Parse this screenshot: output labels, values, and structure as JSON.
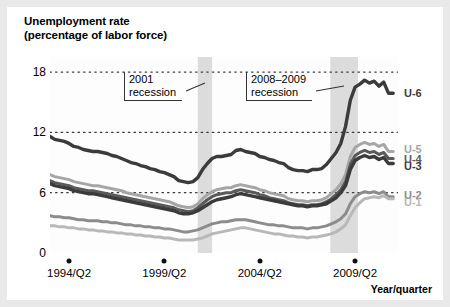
{
  "chart_data": {
    "type": "line",
    "title": "Unemployment rate",
    "subtitle": "(percentage of labor force)",
    "xlabel": "Year/quarter",
    "ylabel": "Unemployment rate (percentage of labor force)",
    "ylim": [
      0,
      19.5
    ],
    "yticks": [
      0,
      6,
      12,
      18
    ],
    "ytick_labels": [
      "0",
      "6",
      "12",
      "18"
    ],
    "grid": "horizontal-dotted",
    "legend_position": "right-end-of-line",
    "xlim": [
      1993.25,
      2011.5
    ],
    "xticks": [
      1994.25,
      1999.25,
      2004.25,
      2009.25
    ],
    "xtick_labels": [
      "1994/Q2",
      "1999/Q2",
      "2004/Q2",
      "2009/Q2"
    ],
    "annotations": [
      {
        "name": "recession-2001",
        "lines": [
          "2001",
          "recession"
        ],
        "span_start": 2001.0,
        "span_end": 2001.75
      },
      {
        "name": "recession-2008-2009",
        "lines": [
          "2008–2009",
          "recession"
        ],
        "span_start": 2007.95,
        "span_end": 2009.4
      }
    ],
    "shaded_bands": [
      {
        "label": "2001 recession",
        "start": 2001.0,
        "end": 2001.75,
        "color": "#dcdcdc"
      },
      {
        "label": "2008-2009 recession",
        "start": 2007.95,
        "end": 2009.4,
        "color": "#dcdcdc"
      }
    ],
    "x": [
      1993.25,
      1993.5,
      1993.75,
      1994.0,
      1994.25,
      1994.5,
      1994.75,
      1995.0,
      1995.25,
      1995.5,
      1995.75,
      1996.0,
      1996.25,
      1996.5,
      1996.75,
      1997.0,
      1997.25,
      1997.5,
      1997.75,
      1998.0,
      1998.25,
      1998.5,
      1998.75,
      1999.0,
      1999.25,
      1999.5,
      1999.75,
      2000.0,
      2000.25,
      2000.5,
      2000.75,
      2001.0,
      2001.25,
      2001.5,
      2001.75,
      2002.0,
      2002.25,
      2002.5,
      2002.75,
      2003.0,
      2003.25,
      2003.5,
      2003.75,
      2004.0,
      2004.25,
      2004.5,
      2004.75,
      2005.0,
      2005.25,
      2005.5,
      2005.75,
      2006.0,
      2006.25,
      2006.5,
      2006.75,
      2007.0,
      2007.25,
      2007.5,
      2007.75,
      2008.0,
      2008.25,
      2008.5,
      2008.75,
      2009.0,
      2009.25,
      2009.5,
      2009.75,
      2010.0,
      2010.25,
      2010.5,
      2010.75,
      2011.0,
      2011.25
    ],
    "series": [
      {
        "name": "U-6",
        "color": "#3b3b3b",
        "width": 3.4,
        "label": "U-6",
        "values": [
          11.6,
          11.3,
          11.2,
          11.1,
          10.9,
          10.6,
          10.5,
          10.3,
          10.2,
          10.1,
          10.1,
          10.0,
          9.9,
          9.7,
          9.6,
          9.4,
          9.2,
          9.0,
          8.9,
          8.7,
          8.6,
          8.4,
          8.3,
          8.1,
          8.0,
          7.8,
          7.6,
          7.2,
          7.1,
          7.0,
          7.1,
          7.5,
          8.3,
          8.9,
          9.4,
          9.6,
          9.6,
          9.7,
          9.8,
          10.2,
          10.3,
          10.1,
          10.0,
          9.9,
          9.6,
          9.5,
          9.3,
          9.2,
          9.0,
          8.9,
          8.5,
          8.3,
          8.2,
          8.2,
          8.1,
          8.3,
          8.3,
          8.4,
          8.8,
          9.4,
          10.0,
          10.9,
          12.6,
          15.2,
          16.5,
          16.8,
          17.2,
          16.9,
          17.1,
          16.6,
          17.0,
          15.9,
          15.9
        ]
      },
      {
        "name": "U-5",
        "color": "#a6a6a6",
        "width": 3.0,
        "label": "U-5",
        "values": [
          7.8,
          7.6,
          7.5,
          7.4,
          7.3,
          7.1,
          7.0,
          6.9,
          6.8,
          6.7,
          6.7,
          6.6,
          6.5,
          6.4,
          6.3,
          6.2,
          6.0,
          5.9,
          5.8,
          5.7,
          5.6,
          5.5,
          5.4,
          5.3,
          5.2,
          5.1,
          4.9,
          4.7,
          4.6,
          4.5,
          4.6,
          4.9,
          5.4,
          5.8,
          6.1,
          6.3,
          6.4,
          6.5,
          6.5,
          6.7,
          6.8,
          6.7,
          6.6,
          6.5,
          6.3,
          6.2,
          6.0,
          5.9,
          5.8,
          5.7,
          5.4,
          5.3,
          5.2,
          5.2,
          5.1,
          5.2,
          5.2,
          5.3,
          5.5,
          5.9,
          6.3,
          6.9,
          7.8,
          9.6,
          10.5,
          10.8,
          11.0,
          10.8,
          10.9,
          10.6,
          10.8,
          10.1,
          10.1
        ]
      },
      {
        "name": "U-4",
        "color": "#5a5a5a",
        "width": 3.0,
        "label": "U-4",
        "values": [
          7.2,
          7.0,
          6.9,
          6.8,
          6.7,
          6.5,
          6.4,
          6.3,
          6.2,
          6.2,
          6.1,
          6.0,
          5.9,
          5.8,
          5.7,
          5.6,
          5.5,
          5.4,
          5.3,
          5.2,
          5.1,
          5.0,
          4.9,
          4.8,
          4.7,
          4.6,
          4.5,
          4.3,
          4.2,
          4.1,
          4.2,
          4.5,
          4.9,
          5.3,
          5.6,
          5.8,
          5.9,
          6.0,
          6.0,
          6.2,
          6.3,
          6.2,
          6.1,
          6.0,
          5.8,
          5.7,
          5.5,
          5.4,
          5.3,
          5.2,
          5.0,
          4.9,
          4.8,
          4.8,
          4.7,
          4.8,
          4.8,
          4.9,
          5.1,
          5.4,
          5.8,
          6.3,
          7.1,
          8.8,
          9.7,
          10.0,
          10.2,
          10.0,
          10.1,
          9.8,
          10.0,
          9.4,
          9.4
        ]
      },
      {
        "name": "U-3",
        "color": "#3b3b3b",
        "width": 3.4,
        "label": "U-3",
        "values": [
          6.9,
          6.7,
          6.6,
          6.5,
          6.4,
          6.2,
          6.1,
          6.0,
          5.9,
          5.9,
          5.8,
          5.7,
          5.6,
          5.5,
          5.4,
          5.3,
          5.2,
          5.1,
          5.0,
          4.9,
          4.8,
          4.7,
          4.6,
          4.5,
          4.4,
          4.3,
          4.2,
          4.0,
          3.9,
          3.9,
          4.0,
          4.2,
          4.5,
          4.8,
          5.1,
          5.3,
          5.4,
          5.5,
          5.6,
          5.8,
          5.9,
          5.8,
          5.7,
          5.6,
          5.5,
          5.4,
          5.3,
          5.2,
          5.1,
          5.0,
          4.9,
          4.8,
          4.7,
          4.7,
          4.6,
          4.7,
          4.7,
          4.8,
          4.9,
          5.2,
          5.5,
          6.0,
          6.7,
          8.3,
          9.2,
          9.5,
          9.7,
          9.5,
          9.6,
          9.3,
          9.5,
          8.9,
          8.9
        ]
      },
      {
        "name": "U-2",
        "color": "#8c8c8c",
        "width": 3.0,
        "label": "U-2",
        "values": [
          3.7,
          3.6,
          3.6,
          3.5,
          3.5,
          3.4,
          3.3,
          3.3,
          3.2,
          3.2,
          3.2,
          3.1,
          3.1,
          3.0,
          3.0,
          2.9,
          2.8,
          2.8,
          2.7,
          2.7,
          2.6,
          2.6,
          2.5,
          2.5,
          2.4,
          2.4,
          2.3,
          2.2,
          2.1,
          2.1,
          2.2,
          2.3,
          2.5,
          2.7,
          2.9,
          3.0,
          3.1,
          3.1,
          3.2,
          3.3,
          3.3,
          3.3,
          3.2,
          3.1,
          3.0,
          2.9,
          2.8,
          2.8,
          2.7,
          2.7,
          2.6,
          2.5,
          2.5,
          2.5,
          2.4,
          2.5,
          2.5,
          2.6,
          2.7,
          2.9,
          3.1,
          3.4,
          3.9,
          4.9,
          5.6,
          5.9,
          6.1,
          6.0,
          6.1,
          5.9,
          6.1,
          5.6,
          5.6
        ]
      },
      {
        "name": "U-1",
        "color": "#b8b8b8",
        "width": 3.0,
        "label": "U-1",
        "values": [
          2.7,
          2.7,
          2.6,
          2.6,
          2.5,
          2.5,
          2.4,
          2.4,
          2.3,
          2.3,
          2.2,
          2.2,
          2.1,
          2.1,
          2.0,
          2.0,
          1.9,
          1.9,
          1.8,
          1.8,
          1.7,
          1.7,
          1.6,
          1.6,
          1.5,
          1.5,
          1.4,
          1.3,
          1.3,
          1.3,
          1.3,
          1.4,
          1.5,
          1.7,
          1.9,
          2.0,
          2.1,
          2.2,
          2.3,
          2.4,
          2.5,
          2.5,
          2.4,
          2.3,
          2.2,
          2.1,
          2.0,
          1.9,
          1.9,
          1.8,
          1.7,
          1.7,
          1.6,
          1.6,
          1.5,
          1.6,
          1.6,
          1.7,
          1.8,
          1.9,
          2.1,
          2.4,
          2.8,
          3.7,
          4.5,
          5.0,
          5.4,
          5.5,
          5.6,
          5.5,
          5.7,
          5.4,
          5.4
        ]
      }
    ],
    "legend_entries": [
      {
        "label": "U-6",
        "color": "#3b3b3b",
        "value_at_end": 15.9
      },
      {
        "label": "U-5",
        "color": "#a6a6a6",
        "value_at_end": 10.1
      },
      {
        "label": "U-4",
        "color": "#5a5a5a",
        "value_at_end": 9.4
      },
      {
        "label": "U-3",
        "color": "#3b3b3b",
        "value_at_end": 8.9
      },
      {
        "label": "U-2",
        "color": "#8c8c8c",
        "value_at_end": 5.6
      },
      {
        "label": "U-1",
        "color": "#b8b8b8",
        "value_at_end": 5.4
      }
    ]
  },
  "colors": {
    "band": "#dcdcdc",
    "grid": "#3a3a3a",
    "frame": "#e9e9e9",
    "plot_bg": "#fdfdfd"
  }
}
